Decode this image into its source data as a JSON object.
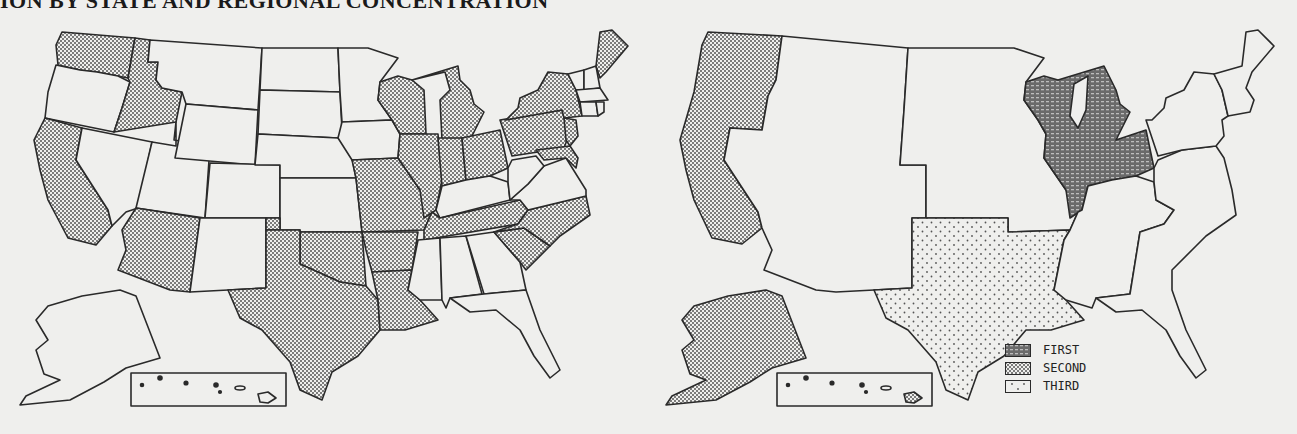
{
  "title": "ION BY STATE AND REGIONAL CONCENTRATION",
  "colors": {
    "background": "#efefed",
    "outline": "#2a2a2a",
    "shaded_fill": "#9a9a9a",
    "first_fill": "#555555"
  },
  "left_map": {
    "caption": "By state",
    "shaded_states": [
      "WA",
      "ID",
      "CA",
      "AZ",
      "TX",
      "OK",
      "MO",
      "AR",
      "LA",
      "WI",
      "MI",
      "IL",
      "IN",
      "OH",
      "TN",
      "NC",
      "SC",
      "PA",
      "NY",
      "NJ",
      "MD",
      "DE",
      "ME"
    ],
    "unshaded_states": [
      "OR",
      "NV",
      "MT",
      "WY",
      "UT",
      "CO",
      "NM",
      "ND",
      "SD",
      "NE",
      "KS",
      "MN",
      "IA",
      "KY",
      "WV",
      "VA",
      "MS",
      "AL",
      "GA",
      "FL",
      "VT",
      "NH",
      "MA",
      "CT",
      "RI",
      "AK",
      "HI"
    ]
  },
  "right_map": {
    "caption": "Regional concentration",
    "regions": [
      {
        "rank": "FIRST",
        "name": "East North Central",
        "states": [
          "WI",
          "MI",
          "IL",
          "IN",
          "OH"
        ]
      },
      {
        "rank": "SECOND",
        "name": "Pacific",
        "states": [
          "WA",
          "OR",
          "CA",
          "AK",
          "HI"
        ]
      },
      {
        "rank": "THIRD",
        "name": "West South Central",
        "states": [
          "TX",
          "OK",
          "AR",
          "LA"
        ]
      }
    ]
  },
  "legend": {
    "items": [
      {
        "label": "FIRST",
        "pattern": "dense-dash"
      },
      {
        "label": "SECOND",
        "pattern": "fine-dot"
      },
      {
        "label": "THIRD",
        "pattern": "sparse-dot"
      }
    ]
  }
}
